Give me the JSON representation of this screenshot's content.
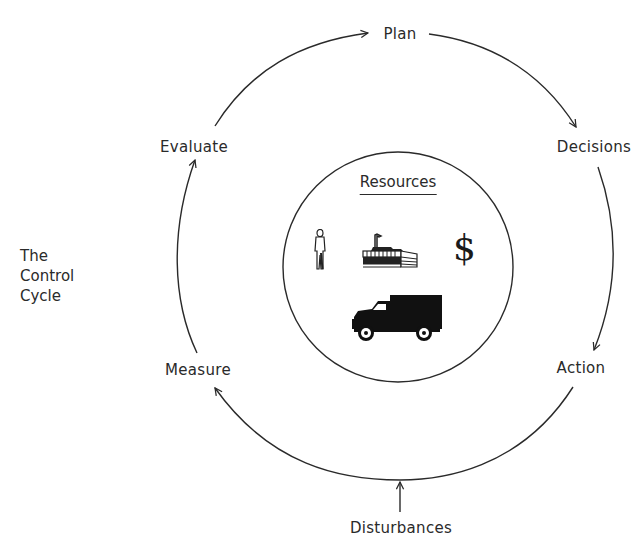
{
  "diagram": {
    "title_lines": [
      "The",
      "Control",
      "Cycle"
    ],
    "cycle_nodes": [
      {
        "id": "plan",
        "label": "Plan"
      },
      {
        "id": "decisions",
        "label": "Decisions"
      },
      {
        "id": "action",
        "label": "Action"
      },
      {
        "id": "measure",
        "label": "Measure"
      },
      {
        "id": "evaluate",
        "label": "Evaluate"
      }
    ],
    "cycle_edges": [
      {
        "from": "Evaluate",
        "to": "Plan"
      },
      {
        "from": "Plan",
        "to": "Decisions"
      },
      {
        "from": "Decisions",
        "to": "Action"
      },
      {
        "from": "Action",
        "to": "Measure"
      },
      {
        "from": "Measure",
        "to": "Evaluate"
      }
    ],
    "external_input": {
      "label": "Disturbances",
      "target": "Action to Measure edge"
    },
    "center": {
      "label": "Resources",
      "icons": [
        "person-icon",
        "factory-icon",
        "dollar-icon",
        "truck-icon"
      ],
      "dollar_glyph": "$"
    },
    "colors": {
      "line": "#2a2a2a",
      "background": "#ffffff"
    }
  }
}
